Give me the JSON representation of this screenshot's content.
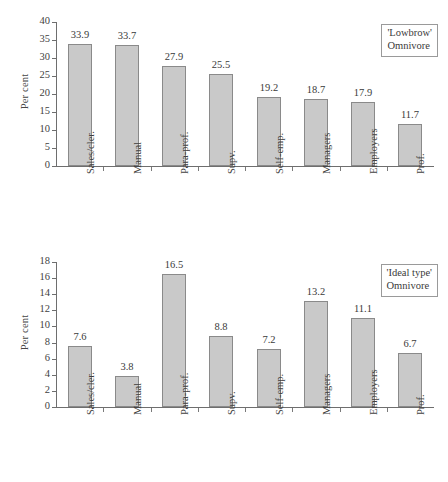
{
  "figure": {
    "ylabel": "Per cent",
    "caption_fragment": ""
  },
  "chart_data": [
    {
      "type": "bar",
      "title": "'Lowbrow' Omnivore",
      "legend_lines": [
        "'Lowbrow'",
        "Omnivore"
      ],
      "legend_position": "top-right",
      "xlabel": "",
      "ylabel": "Per cent",
      "ylim": [
        0,
        40
      ],
      "yticks": [
        0,
        5,
        10,
        15,
        20,
        25,
        30,
        35,
        40
      ],
      "grid": false,
      "categories": [
        "Sales/cler.",
        "Manual",
        "Para-prof.",
        "Supv.",
        "Self-emp.",
        "Managers",
        "Employers",
        "Prof."
      ],
      "values": [
        33.9,
        33.7,
        27.9,
        25.5,
        19.2,
        18.7,
        17.9,
        11.7
      ],
      "labels": [
        "33.9",
        "33.7",
        "27.9",
        "25.5",
        "19.2",
        "18.7",
        "17.9",
        "11.7"
      ]
    },
    {
      "type": "bar",
      "title": "'Ideal type' Omnivore",
      "legend_lines": [
        "'Ideal type'",
        "Omnivore"
      ],
      "legend_position": "top-right",
      "xlabel": "",
      "ylabel": "Per cent",
      "ylim": [
        0,
        18
      ],
      "yticks": [
        0,
        2,
        4,
        6,
        8,
        10,
        12,
        14,
        16,
        18
      ],
      "grid": false,
      "categories": [
        "Sales/cler.",
        "Manual",
        "Para-prof.",
        "Supv.",
        "Self-emp.",
        "Managers",
        "Employers",
        "Prof."
      ],
      "values": [
        7.6,
        3.8,
        16.5,
        8.8,
        7.2,
        13.2,
        11.1,
        6.7
      ],
      "labels": [
        "7.6",
        "3.8",
        "16.5",
        "8.8",
        "7.2",
        "13.2",
        "11.1",
        "6.7"
      ]
    }
  ]
}
